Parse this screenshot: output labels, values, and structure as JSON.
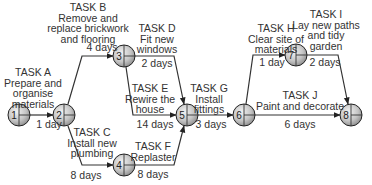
{
  "diagram": {
    "type": "critical-path-network",
    "nodes": [
      {
        "id": "1",
        "label": "1"
      },
      {
        "id": "2",
        "label": "2"
      },
      {
        "id": "3",
        "label": "3"
      },
      {
        "id": "4",
        "label": "4"
      },
      {
        "id": "5",
        "label": "5"
      },
      {
        "id": "6",
        "label": "6"
      },
      {
        "id": "7",
        "label": "7"
      },
      {
        "id": "8",
        "label": "8"
      }
    ],
    "tasks": [
      {
        "id": "A",
        "name": "TASK A",
        "description": [
          "Prepare and",
          "organise",
          "materials"
        ],
        "duration": "1 day",
        "from": "1",
        "to": "2"
      },
      {
        "id": "B",
        "name": "TASK B",
        "description": [
          "Remove and",
          "replace brickwork",
          "and flooring"
        ],
        "duration": "4 days",
        "from": "2",
        "to": "3"
      },
      {
        "id": "C",
        "name": "TASK C",
        "description": [
          "Install new",
          "plumbing"
        ],
        "duration": "8 days",
        "from": "2",
        "to": "4"
      },
      {
        "id": "D",
        "name": "TASK D",
        "description": [
          "Fit new",
          "windows"
        ],
        "duration": "2 days",
        "from": "3",
        "to": "5"
      },
      {
        "id": "E",
        "name": "TASK E",
        "description": [
          "Rewire the",
          "house"
        ],
        "duration": "14 days",
        "from": "3",
        "to": "5"
      },
      {
        "id": "F",
        "name": "TASK F",
        "description": [
          "Replaster"
        ],
        "duration": "8 days",
        "from": "4",
        "to": "5"
      },
      {
        "id": "G",
        "name": "TASK G",
        "description": [
          "Install",
          "fittings"
        ],
        "duration": "3 days",
        "from": "5",
        "to": "6"
      },
      {
        "id": "H",
        "name": "TASK H",
        "description": [
          "Clear site of",
          "materials"
        ],
        "duration": "1 day",
        "from": "6",
        "to": "7"
      },
      {
        "id": "I",
        "name": "TASK I",
        "description": [
          "Lay new paths",
          "and tidy",
          "garden"
        ],
        "duration": "2 days",
        "from": "7",
        "to": "8"
      },
      {
        "id": "J",
        "name": "TASK J",
        "description": [
          "Paint and decorate"
        ],
        "duration": "6 days",
        "from": "6",
        "to": "8"
      }
    ],
    "colors": {
      "line": "#333333",
      "node_fill_light": "#e6e6e6",
      "node_fill_dark": "#9a9a9a",
      "text": "#333333"
    }
  }
}
